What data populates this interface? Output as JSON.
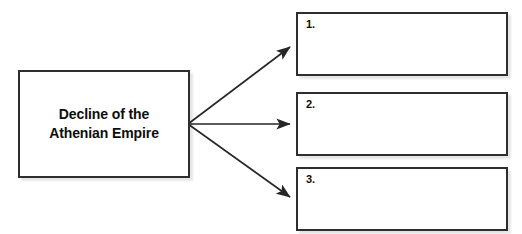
{
  "diagram": {
    "type": "cause-and-effect graphic organizer",
    "source": {
      "label": "Decline of the\nAthenian Empire"
    },
    "effects": [
      {
        "number": "1.",
        "text": ""
      },
      {
        "number": "2.",
        "text": ""
      },
      {
        "number": "3.",
        "text": ""
      }
    ],
    "connectors": [
      {
        "name": "arrow-to-effect-1",
        "from": [
          188,
          124
        ],
        "to": [
          292,
          46
        ]
      },
      {
        "name": "arrow-to-effect-2",
        "from": [
          188,
          124
        ],
        "to": [
          292,
          124
        ]
      },
      {
        "name": "arrow-to-effect-3",
        "from": [
          188,
          124
        ],
        "to": [
          292,
          199
        ]
      }
    ],
    "colors": {
      "background": "#ffffff",
      "border": "#2e2e2e",
      "text": "#0d0d0d",
      "connector": "#262626"
    }
  }
}
